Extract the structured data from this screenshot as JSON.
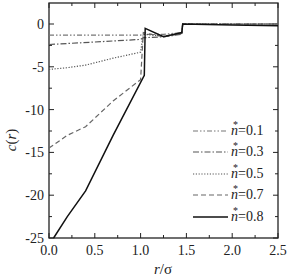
{
  "chart_data": {
    "type": "line",
    "title": "",
    "xlabel": "r/σ",
    "ylabel": "c(r)",
    "xlim": [
      0.0,
      2.5
    ],
    "ylim": [
      -25,
      2.5
    ],
    "xticks": [
      "0.0",
      "0.5",
      "1.0",
      "1.5",
      "2.0",
      "2.5"
    ],
    "yticks": [
      "0",
      "-5",
      "-10",
      "-15",
      "-20",
      "-25"
    ],
    "grid": false,
    "legend_position": "lower right",
    "series": [
      {
        "name": "n*=0.1",
        "style": "dash-dot-dot",
        "x": [
          0.0,
          0.5,
          1.0,
          1.03,
          1.25,
          1.45,
          1.46,
          2.0,
          2.5
        ],
        "y": [
          -1.3,
          -1.3,
          -1.3,
          -1.2,
          -1.2,
          -1.0,
          0.0,
          0.0,
          0.0
        ]
      },
      {
        "name": "n*=0.3",
        "style": "dash-dot",
        "x": [
          0.0,
          0.5,
          1.0,
          1.03,
          1.25,
          1.45,
          1.46,
          2.0,
          2.5
        ],
        "y": [
          -2.4,
          -2.1,
          -1.8,
          -1.6,
          -1.5,
          -1.2,
          0.0,
          0.0,
          0.0
        ]
      },
      {
        "name": "n*=0.5",
        "style": "dotted",
        "x": [
          0.0,
          0.2,
          0.4,
          0.7,
          1.0,
          1.03,
          1.25,
          1.45,
          1.46,
          2.0,
          2.5
        ],
        "y": [
          -5.3,
          -5.1,
          -4.8,
          -4.0,
          -3.3,
          -1.2,
          -1.4,
          -1.1,
          0.0,
          0.0,
          0.0
        ]
      },
      {
        "name": "n*=0.7",
        "style": "dashed",
        "x": [
          0.0,
          0.2,
          0.4,
          0.7,
          1.0,
          1.03,
          1.25,
          1.45,
          1.46,
          2.0,
          2.5
        ],
        "y": [
          -14.5,
          -13.0,
          -12.0,
          -9.0,
          -6.5,
          -1.0,
          -1.5,
          -1.1,
          0.0,
          0.0,
          0.0
        ]
      },
      {
        "name": "n*=0.8",
        "style": "solid",
        "x": [
          0.05,
          0.2,
          0.4,
          0.7,
          1.04,
          1.05,
          1.25,
          1.45,
          1.46,
          2.0,
          2.5
        ],
        "y": [
          -25.0,
          -22.5,
          -19.5,
          -13.0,
          -6.0,
          -0.5,
          -1.5,
          -1.0,
          0.0,
          -0.1,
          -0.2
        ]
      }
    ]
  },
  "legend": {
    "entries": [
      {
        "label_n": "n",
        "label_star": "*",
        "label_val": "=0.1"
      },
      {
        "label_n": "n",
        "label_star": "*",
        "label_val": "=0.3"
      },
      {
        "label_n": "n",
        "label_star": "*",
        "label_val": "=0.5"
      },
      {
        "label_n": "n",
        "label_star": "*",
        "label_val": "=0.7"
      },
      {
        "label_n": "n",
        "label_star": "*",
        "label_val": "=0.8"
      }
    ]
  },
  "axes": {
    "x_title_r": "r",
    "x_title_rest": "/σ",
    "y_title_c": "c",
    "y_title_rest": "(r)"
  }
}
